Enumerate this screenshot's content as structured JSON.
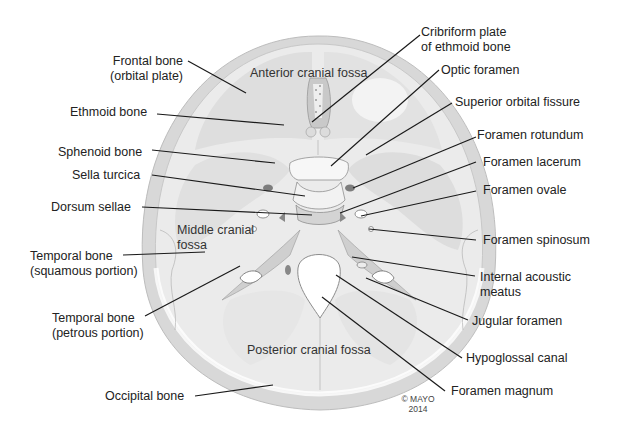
{
  "figure": {
    "copyright_line1": "© MAYO",
    "copyright_line2": "2014"
  },
  "regions": {
    "anterior": "Anterior cranial fossa",
    "middle_line1": "Middle cranial",
    "middle_line2": "fossa",
    "posterior": "Posterior cranial fossa"
  },
  "left_labels": [
    {
      "line1": "Frontal bone",
      "line2": "(orbital plate)"
    },
    {
      "line1": "Ethmoid bone"
    },
    {
      "line1": "Sphenoid bone"
    },
    {
      "line1": "Sella turcica"
    },
    {
      "line1": "Dorsum sellae"
    },
    {
      "line1": "Temporal bone",
      "line2": "(squamous portion)"
    },
    {
      "line1": "Temporal bone",
      "line2": "(petrous portion)"
    },
    {
      "line1": "Occipital bone"
    }
  ],
  "right_labels": [
    {
      "line1": "Cribriform plate",
      "line2": "of ethmoid bone"
    },
    {
      "line1": "Optic foramen"
    },
    {
      "line1": "Superior orbital fissure"
    },
    {
      "line1": "Foramen rotundum"
    },
    {
      "line1": "Foramen lacerum"
    },
    {
      "line1": "Foramen ovale"
    },
    {
      "line1": "Foramen spinosum"
    },
    {
      "line1": "Internal acoustic",
      "line2": "meatus"
    },
    {
      "line1": "Jugular foramen"
    },
    {
      "line1": "Hypoglossal canal"
    },
    {
      "line1": "Foramen magnum"
    }
  ],
  "colors": {
    "bone_outer": "#d9d9d9",
    "bone_fill": "#ececec",
    "bone_light": "#f6f6f6",
    "shadow": "#a8a8a8",
    "leader": "#1a1a1a"
  }
}
